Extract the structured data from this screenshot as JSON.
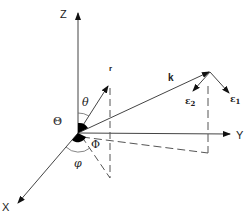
{
  "diagram": {
    "axes": {
      "z": {
        "label": "Z"
      },
      "y": {
        "label": "Y"
      },
      "x": {
        "label": "X"
      }
    },
    "vectors": {
      "r": {
        "label": "r"
      },
      "k": {
        "label": "k"
      },
      "e1": {
        "label": "ε",
        "subscript": "1"
      },
      "e2": {
        "label": "ε",
        "subscript": "2"
      }
    },
    "angles": {
      "theta_small": "θ",
      "theta_capital": "Θ",
      "phi_capital": "Φ",
      "phi_small": "φ"
    },
    "colors": {
      "line": "#333333",
      "fill": "#000000",
      "background": "#ffffff"
    }
  }
}
